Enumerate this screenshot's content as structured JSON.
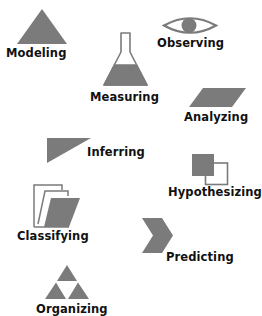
{
  "colors": {
    "icon_fill": "#7b7b7b",
    "icon_stroke": "#7b7b7b",
    "label_text": "#111111",
    "background": "#ffffff"
  },
  "skills": [
    {
      "id": "modeling",
      "label": "Modeling",
      "icon": "triangle-icon"
    },
    {
      "id": "observing",
      "label": "Observing",
      "icon": "eye-icon"
    },
    {
      "id": "measuring",
      "label": "Measuring",
      "icon": "flask-icon"
    },
    {
      "id": "analyzing",
      "label": "Analyzing",
      "icon": "parallelogram-icon"
    },
    {
      "id": "inferring",
      "label": "Inferring",
      "icon": "right-triangle-icon"
    },
    {
      "id": "hypothesizing",
      "label": "Hypothesizing",
      "icon": "overlapping-squares-icon"
    },
    {
      "id": "classifying",
      "label": "Classifying",
      "icon": "folder-icon"
    },
    {
      "id": "predicting",
      "label": "Predicting",
      "icon": "chevron-icon"
    },
    {
      "id": "organizing",
      "label": "Organizing",
      "icon": "triforce-icon"
    }
  ]
}
